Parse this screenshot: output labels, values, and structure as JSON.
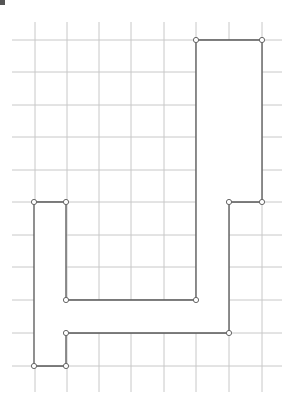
{
  "diagram": {
    "type": "grid-polygon",
    "grid": {
      "vertical_x": [
        35,
        67,
        99,
        131,
        164,
        196,
        229,
        262
      ],
      "vertical_y_range": [
        22,
        392
      ],
      "horizontal_y": [
        40,
        72,
        105,
        137,
        170,
        202,
        235,
        267,
        300,
        333,
        366
      ],
      "horizontal_x_range": [
        12,
        282
      ],
      "color": "#c8c8c8"
    },
    "polygon": {
      "stroke": "#555555",
      "points": [
        [
          196,
          40
        ],
        [
          262,
          40
        ],
        [
          262,
          202
        ],
        [
          229,
          202
        ],
        [
          229,
          333
        ],
        [
          66,
          333
        ],
        [
          66,
          366
        ],
        [
          34,
          366
        ],
        [
          34,
          202
        ],
        [
          66,
          202
        ],
        [
          66,
          300
        ],
        [
          196,
          300
        ]
      ]
    }
  }
}
